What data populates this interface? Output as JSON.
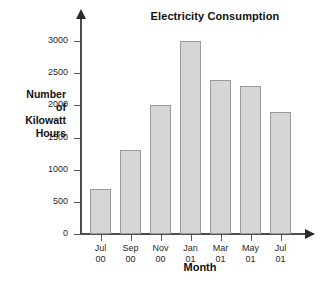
{
  "chart_data": {
    "type": "bar",
    "title": "Electricity Consumption",
    "xlabel": "Month",
    "ylabel": "Number of Kilowatt Hours",
    "ylabel_lines": [
      "Number",
      "of",
      "Kilowatt",
      "Hours"
    ],
    "categories": [
      "Jul 00",
      "Sep 00",
      "Nov 00",
      "Jan 01",
      "Mar 01",
      "May 01",
      "Jul 01"
    ],
    "category_parts": [
      {
        "month": "Jul",
        "year": "00"
      },
      {
        "month": "Sep",
        "year": "00"
      },
      {
        "month": "Nov",
        "year": "00"
      },
      {
        "month": "Jan",
        "year": "01"
      },
      {
        "month": "Mar",
        "year": "01"
      },
      {
        "month": "May",
        "year": "01"
      },
      {
        "month": "Jul",
        "year": "01"
      }
    ],
    "values": [
      700,
      1300,
      2000,
      3000,
      2400,
      2300,
      1900
    ],
    "ylim": [
      0,
      3000
    ],
    "yticks": [
      0,
      500,
      1000,
      1500,
      2000,
      2500,
      3000
    ],
    "ytick_labels": [
      "0",
      "500",
      "1000",
      "1500",
      "2000",
      "2500",
      "3000"
    ],
    "grid": false,
    "legend": false,
    "bar_fill_color": "#d6d6d6",
    "bar_border_color": "#9a9a9a",
    "axis_color": "#4d4d4d",
    "text_color": "#111111"
  }
}
